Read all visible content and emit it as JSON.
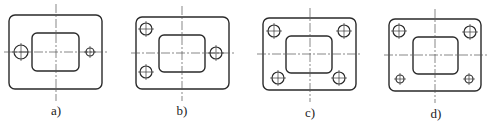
{
  "figure": {
    "panels": [
      {
        "id": "a",
        "label": "a)",
        "outer": {
          "x": 9,
          "y": 15,
          "w": 93,
          "h": 74,
          "r": 6
        },
        "inner": {
          "x": 32,
          "y": 33,
          "w": 47,
          "h": 38,
          "r": 5
        },
        "center": {
          "x": 56,
          "y": 52
        },
        "vline": {
          "y1": 4,
          "y2": 101
        },
        "hline": {
          "x1": 4,
          "x2": 108
        },
        "holes": [
          {
            "cx": 21,
            "cy": 52,
            "r": 7
          },
          {
            "cx": 90,
            "cy": 52,
            "r": 4
          }
        ],
        "label_pos": {
          "x": 56,
          "y": 115
        }
      },
      {
        "id": "b",
        "label": "b)",
        "outer": {
          "x": 136,
          "y": 17,
          "w": 93,
          "h": 72,
          "r": 6
        },
        "inner": {
          "x": 159,
          "y": 35,
          "w": 46,
          "h": 37,
          "r": 5
        },
        "center": {
          "x": 182,
          "y": 53
        },
        "vline": {
          "y1": 6,
          "y2": 101
        },
        "hline": {
          "x1": 131,
          "x2": 236
        },
        "holes": [
          {
            "cx": 146,
            "cy": 29,
            "r": 6
          },
          {
            "cx": 146,
            "cy": 72,
            "r": 6
          },
          {
            "cx": 216,
            "cy": 53,
            "r": 6
          }
        ],
        "label_pos": {
          "x": 182,
          "y": 115
        }
      },
      {
        "id": "c",
        "label": "c)",
        "outer": {
          "x": 263,
          "y": 18,
          "w": 93,
          "h": 72,
          "r": 6
        },
        "inner": {
          "x": 286,
          "y": 36,
          "w": 46,
          "h": 37,
          "r": 5
        },
        "center": {
          "x": 310,
          "y": 54
        },
        "vline": {
          "y1": 8,
          "y2": 102
        },
        "hline": {
          "x1": 257,
          "x2": 362
        },
        "holes": [
          {
            "cx": 274,
            "cy": 31,
            "r": 6
          },
          {
            "cx": 344,
            "cy": 31,
            "r": 6
          },
          {
            "cx": 278,
            "cy": 78,
            "r": 6
          },
          {
            "cx": 339,
            "cy": 78,
            "r": 6
          }
        ],
        "label_pos": {
          "x": 310,
          "y": 117
        }
      },
      {
        "id": "d",
        "label": "d)",
        "outer": {
          "x": 389,
          "y": 19,
          "w": 92,
          "h": 72,
          "r": 6
        },
        "inner": {
          "x": 413,
          "y": 37,
          "w": 45,
          "h": 37,
          "r": 5
        },
        "center": {
          "x": 435,
          "y": 55
        },
        "vline": {
          "y1": 9,
          "y2": 103
        },
        "hline": {
          "x1": 384,
          "x2": 487
        },
        "holes": [
          {
            "cx": 399,
            "cy": 31,
            "r": 6
          },
          {
            "cx": 470,
            "cy": 32,
            "r": 6
          },
          {
            "cx": 400,
            "cy": 79,
            "r": 4
          },
          {
            "cx": 469,
            "cy": 79,
            "r": 4
          }
        ],
        "label_pos": {
          "x": 436,
          "y": 118
        }
      }
    ]
  }
}
